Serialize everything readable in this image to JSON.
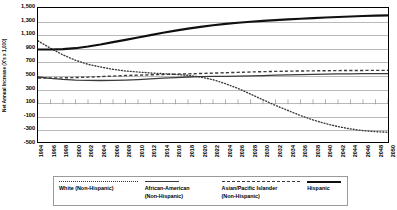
{
  "chart_data": {
    "type": "line",
    "title": "",
    "xlabel": "",
    "ylabel": "Net Annual Increase (X's x 1,000)",
    "ylim": [
      -500,
      1500
    ],
    "xlim": [
      1994,
      2050
    ],
    "grid": true,
    "legend_position": "bottom",
    "yticks": [
      1500,
      1300,
      1100,
      900,
      700,
      500,
      300,
      100,
      -100,
      -300,
      -500
    ],
    "ytick_labels": [
      "1,500",
      "1,300",
      "1,100",
      "900",
      "700",
      "500",
      "300",
      "100",
      "-100",
      "-300",
      "-500"
    ],
    "x": [
      1994,
      1996,
      1998,
      2000,
      2002,
      2004,
      2006,
      2008,
      2010,
      2012,
      2014,
      2016,
      2018,
      2020,
      2022,
      2024,
      2026,
      2028,
      2030,
      2032,
      2034,
      2036,
      2038,
      2040,
      2042,
      2044,
      2046,
      2048,
      2050
    ],
    "xtick_labels": [
      "1994",
      "1996",
      "1998",
      "2000",
      "2002",
      "2004",
      "2006",
      "2008",
      "2010",
      "2012",
      "2014",
      "2016",
      "2018",
      "2020",
      "2022",
      "2024",
      "2026",
      "2028",
      "2030",
      "2032",
      "2034",
      "2036",
      "2038",
      "2040",
      "2042",
      "2044",
      "2046",
      "2048",
      "2050"
    ],
    "series": [
      {
        "name": "White (Non-Hispanic)",
        "style": "dotted",
        "color": "#3a3a3a",
        "width": 1.4,
        "values": [
          1010,
          900,
          800,
          720,
          660,
          620,
          585,
          560,
          545,
          530,
          520,
          510,
          495,
          470,
          430,
          370,
          300,
          215,
          130,
          45,
          -30,
          -105,
          -170,
          -225,
          -270,
          -305,
          -330,
          -345,
          -355
        ]
      },
      {
        "name": "African-American (Non-Hispanic)",
        "style": "solid-thin",
        "color": "#3a3a3a",
        "width": 1.3,
        "values": [
          470,
          450,
          435,
          425,
          420,
          418,
          420,
          425,
          432,
          442,
          452,
          462,
          470,
          475,
          478,
          480,
          483,
          487,
          492,
          497,
          502,
          506,
          510,
          513,
          516,
          518,
          519,
          520,
          520
        ]
      },
      {
        "name": "Asian/Pacific Islander (Non-Hispanic)",
        "style": "dashed",
        "color": "#3a3a3a",
        "width": 1.4,
        "values": [
          455,
          455,
          458,
          462,
          468,
          476,
          484,
          492,
          498,
          503,
          508,
          512,
          517,
          522,
          528,
          534,
          540,
          545,
          550,
          554,
          557,
          560,
          562,
          564,
          566,
          567,
          568,
          569,
          570
        ]
      },
      {
        "name": "Hispanic",
        "style": "solid-thick",
        "color": "#101010",
        "width": 2.2,
        "values": [
          880,
          880,
          885,
          900,
          925,
          955,
          990,
          1025,
          1060,
          1095,
          1130,
          1162,
          1192,
          1218,
          1242,
          1262,
          1280,
          1295,
          1308,
          1320,
          1330,
          1340,
          1350,
          1358,
          1366,
          1373,
          1380,
          1385,
          1390
        ]
      }
    ]
  },
  "legend": {
    "entries": [
      {
        "label": "White (Non-Hispanic)",
        "key": "dotted"
      },
      {
        "label": "African-American\n(Non-Hispanic)",
        "key": "solid-thin"
      },
      {
        "label": "Asian/Pacific Islander\n(Non-Hispanic)",
        "key": "dashed"
      },
      {
        "label": "Hispanic",
        "key": "solid-thick"
      }
    ]
  },
  "colors": {
    "grid": "#b9b9b9",
    "axis": "#000000",
    "background": "#ffffff",
    "legend_border": "#9a9a9a"
  }
}
